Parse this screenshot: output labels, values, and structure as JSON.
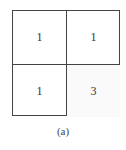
{
  "figure": {
    "cells": [
      {
        "row": 0,
        "col": 0,
        "value": "1"
      },
      {
        "row": 0,
        "col": 1,
        "value": "1"
      },
      {
        "row": 1,
        "col": 0,
        "value": "1"
      },
      {
        "row": 1,
        "col": 1,
        "value": "3"
      }
    ],
    "caption": "(a)"
  }
}
